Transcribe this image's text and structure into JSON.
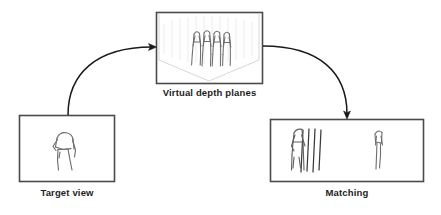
{
  "figure": {
    "background_color": "#ffffff",
    "box_stroke_color": "#4a4a4a",
    "arrow_color": "#1a1a1a",
    "skeleton_color": "#6b6b6b",
    "plane_color": "#c9c9c9",
    "caption_color": "#1d1d1d"
  },
  "panels": [
    {
      "id": "virtual-depth-planes",
      "caption": "Virtual depth planes",
      "content_description": "3D perspective view of vertical virtual depth planes with four overlaid stick-figure skeletons",
      "figure_count": 4,
      "x": 156,
      "y": 12,
      "width": 107,
      "height": 72
    },
    {
      "id": "target-view",
      "caption": "Target view",
      "content_description": "Single stick-figure skeleton of the target person",
      "figure_count": 1,
      "x": 19,
      "y": 115,
      "width": 96,
      "height": 67
    },
    {
      "id": "matching",
      "caption": "Matching",
      "content_description": "Stick-figure skeleton overlaid with vertical matching lines on the left and a thin matched skeleton on the right",
      "figure_count": 2,
      "x": 270,
      "y": 119,
      "width": 154,
      "height": 63
    }
  ],
  "arrows": [
    {
      "id": "target-to-depth-planes",
      "from": "target-view",
      "to": "virtual-depth-planes",
      "direction": "right",
      "style": "curved"
    },
    {
      "id": "depth-planes-to-matching",
      "from": "virtual-depth-planes",
      "to": "matching",
      "direction": "down",
      "style": "curved"
    }
  ]
}
